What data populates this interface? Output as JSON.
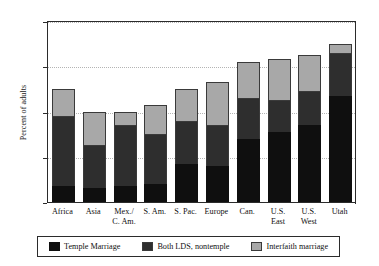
{
  "chart_data": {
    "type": "bar",
    "stacked": true,
    "title": "",
    "xlabel": "",
    "ylabel": "Percent of adults",
    "ylim": [
      0,
      80
    ],
    "yticks": [
      0,
      20,
      40,
      60,
      80
    ],
    "ytick_labels": [
      "0",
      "20",
      "40",
      "60",
      "80"
    ],
    "grid": "horizontal-dotted",
    "legend_position": "bottom",
    "categories": [
      "Africa",
      "Asia",
      "Mex./ C. Am.",
      "S. Am.",
      "S. Pac.",
      "Europe",
      "Can.",
      "U.S. East",
      "U.S. West",
      "Utah"
    ],
    "category_lines": [
      [
        "Africa"
      ],
      [
        "Asia"
      ],
      [
        "Mex./",
        "C. Am."
      ],
      [
        "S. Am."
      ],
      [
        "S. Pac."
      ],
      [
        "Europe"
      ],
      [
        "Can."
      ],
      [
        "U.S.",
        "East"
      ],
      [
        "U.S.",
        "West"
      ],
      [
        "Utah"
      ]
    ],
    "series": [
      {
        "name": "Temple Marriage",
        "key": "temple",
        "color": "#0f0f0f",
        "values": [
          7,
          6,
          7,
          8,
          17,
          16,
          28,
          31,
          34,
          47
        ]
      },
      {
        "name": "Both LDS, nontemple",
        "key": "bothlds",
        "color": "#2e2e2e",
        "values": [
          31,
          19,
          27,
          22,
          19,
          18,
          18,
          14,
          15,
          19
        ]
      },
      {
        "name": "Interfaith marriage",
        "key": "interfaith",
        "color": "#a8a8a8",
        "values": [
          12,
          15,
          6,
          13,
          14,
          19,
          16,
          18,
          16,
          4
        ]
      }
    ],
    "totals": [
      50,
      40,
      40,
      43,
      50,
      53,
      62,
      63,
      65,
      70
    ],
    "cumulative_tops": {
      "temple": [
        7,
        6,
        7,
        8,
        17,
        16,
        28,
        31,
        34,
        47
      ],
      "bothlds": [
        38,
        25,
        34,
        30,
        36,
        34,
        46,
        45,
        49,
        66
      ],
      "interfaith": [
        50,
        40,
        40,
        43,
        50,
        53,
        62,
        63,
        65,
        70
      ]
    }
  },
  "legend": {
    "items": [
      {
        "label": "Temple Marriage",
        "swatch": "temple"
      },
      {
        "label": "Both LDS, nontemple",
        "swatch": "bothlds"
      },
      {
        "label": "Interfaith marriage",
        "swatch": "interfaith"
      }
    ]
  }
}
